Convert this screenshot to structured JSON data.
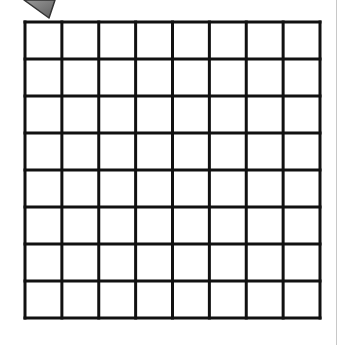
{
  "diagram": {
    "title": "8x8 grid",
    "grid": {
      "rows": 8,
      "cols": 8,
      "left": 25,
      "top": 22,
      "right": 320,
      "bottom": 318,
      "line_color": "#111111",
      "line_width": 3,
      "cell_fill": "#ffffff"
    },
    "pointer": {
      "description": "gray arrow pointing at top-left of grid",
      "fill": "#7a7a7a",
      "stroke": "#333333",
      "tip": [
        49,
        18
      ]
    },
    "edge_line_color": "#c8c8c8"
  }
}
